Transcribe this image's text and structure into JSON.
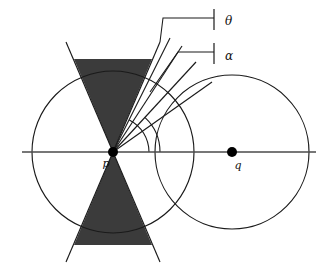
{
  "figure": {
    "background_color": "#ffffff",
    "line_color": "#1a1a1a",
    "shade_color": "#3b3b3b",
    "axis_color": "#4a4a4a",
    "width": 328,
    "height": 264
  },
  "points": [
    {
      "id": "p",
      "label": "p",
      "x": 113,
      "y": 152,
      "label_x": 106,
      "label_y": 167,
      "radius": 5
    },
    {
      "id": "q",
      "label": "q",
      "x": 232,
      "y": 152,
      "label_x": 236,
      "label_y": 169,
      "radius": 5
    }
  ],
  "circles": [
    {
      "id": "circle-p",
      "center_x": 113,
      "center_y": 152,
      "radius": 81
    },
    {
      "id": "circle-q",
      "center_x": 232,
      "center_y": 152,
      "radius": 77
    }
  ],
  "axis": {
    "id": "horizontal-axis",
    "x1": 22,
    "y1": 152,
    "x2": 316,
    "y2": 152
  },
  "cone": {
    "apex_x": 113,
    "apex_y": 152,
    "half_angle_deg": 27,
    "center_angle_deg": 90,
    "extent": 96,
    "upper_points": "113,152 74,59 152,59",
    "lower_points": "113,152 74,245 152,245",
    "edges": [
      {
        "id": "cone-edge-upper-left",
        "x1": 113,
        "y1": 152,
        "x2": 66,
        "y2": 42
      },
      {
        "id": "cone-edge-upper-right",
        "x1": 113,
        "y1": 152,
        "x2": 160,
        "y2": 42
      },
      {
        "id": "cone-edge-lower-left",
        "x1": 113,
        "y1": 152,
        "x2": 66,
        "y2": 262
      },
      {
        "id": "cone-edge-lower-right",
        "x1": 113,
        "y1": 152,
        "x2": 160,
        "y2": 262
      }
    ]
  },
  "rays": [
    {
      "id": "ray-theta",
      "label_ref": "theta",
      "x1": 113,
      "y1": 152,
      "x2": 170,
      "y2": 38,
      "angle_deg": 63
    },
    {
      "id": "ray-mid",
      "label_ref": "",
      "x1": 113,
      "y1": 152,
      "x2": 182,
      "y2": 46,
      "angle_deg": 57
    },
    {
      "id": "ray-alpha",
      "label_ref": "alpha",
      "x1": 113,
      "y1": 152,
      "x2": 196,
      "y2": 62,
      "angle_deg": 47
    },
    {
      "id": "ray-baseline",
      "label_ref": "",
      "x1": 113,
      "y1": 152,
      "x2": 212,
      "y2": 82,
      "angle_deg": 35
    }
  ],
  "angle_arcs": [
    {
      "id": "arc-theta",
      "cx": 113,
      "cy": 152,
      "r": 36,
      "start_deg": 0,
      "end_deg": 63
    },
    {
      "id": "arc-alpha",
      "cx": 113,
      "cy": 152,
      "r": 47,
      "start_deg": 0,
      "end_deg": 47
    }
  ],
  "annotations": [
    {
      "id": "theta",
      "label": "θ",
      "label_x": 225,
      "label_y": 26,
      "leader_path": "M 160 42 L 163 18 L 214 18",
      "tick_x": 214,
      "tick_y1": 9,
      "tick_y2": 30
    },
    {
      "id": "alpha",
      "label": "α",
      "label_x": 225,
      "label_y": 61,
      "leader_path": "M 150 92 L 178 52 L 214 52",
      "tick_x": 214,
      "tick_y1": 43,
      "tick_y2": 64
    }
  ],
  "labels": {
    "point_p": "p",
    "point_q": "q",
    "angle_theta": "θ",
    "angle_alpha": "α"
  }
}
